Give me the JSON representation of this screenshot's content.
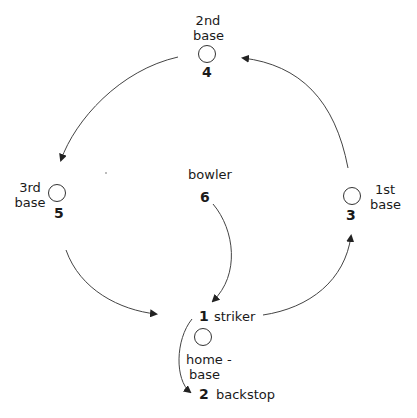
{
  "diagram": {
    "positions": [
      {
        "number": "1",
        "label": "striker"
      },
      {
        "number": "2",
        "label": "backstop"
      },
      {
        "number": "3",
        "label_line1": "1st",
        "label_line2": "base"
      },
      {
        "number": "4",
        "label_line1": "2nd",
        "label_line2": "base"
      },
      {
        "number": "5",
        "label_line1": "3rd",
        "label_line2": "base"
      },
      {
        "number": "6",
        "label": "bowler"
      }
    ],
    "home": {
      "label_line1": "home -",
      "label_line2": "base"
    },
    "colors": {
      "stroke": "#333333",
      "text": "#1a1a1a",
      "background": "#ffffff"
    }
  }
}
